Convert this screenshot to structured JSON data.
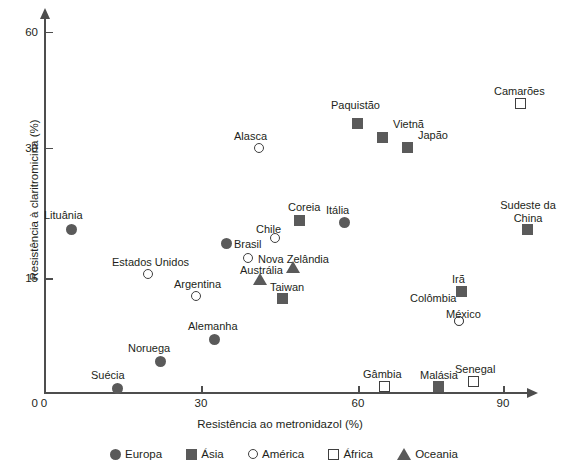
{
  "chart_data": {
    "type": "scatter",
    "title": "",
    "xlabel": "Resistência ao metronidazol (%)",
    "ylabel": "Resistência à claritromicina (%)",
    "xlim": [
      0,
      95
    ],
    "ylim": [
      0,
      63
    ],
    "xticks": [
      "0",
      "30",
      "60",
      "90"
    ],
    "yticks": [
      "0",
      "15",
      "30",
      "60"
    ],
    "grid": false,
    "legend_position": "bottom",
    "legend": [
      {
        "name": "Europa",
        "marker": "filled-circle"
      },
      {
        "name": "Ásia",
        "marker": "filled-square"
      },
      {
        "name": "América",
        "marker": "open-circle"
      },
      {
        "name": "África",
        "marker": "open-square"
      },
      {
        "name": "Oceania",
        "marker": "filled-triangle"
      }
    ],
    "points": [
      {
        "label": "Lituânia",
        "series": "Europa",
        "marker": "filled-circle",
        "x": 4,
        "y": 24,
        "px": 71,
        "py": 229,
        "lx": 44,
        "ly": 209
      },
      {
        "label": "Suécia",
        "series": "Europa",
        "marker": "filled-circle",
        "x": 14,
        "y": 3.5,
        "px": 117,
        "py": 388,
        "lx": 91,
        "ly": 369
      },
      {
        "label": "Noruega",
        "series": "Europa",
        "marker": "filled-circle",
        "x": 22,
        "y": 6,
        "px": 160,
        "py": 361,
        "lx": 128,
        "ly": 342
      },
      {
        "label": "Alemanha",
        "series": "Europa",
        "marker": "filled-circle",
        "x": 32,
        "y": 9,
        "px": 214,
        "py": 339,
        "lx": 188,
        "ly": 320
      },
      {
        "label": "Brasil",
        "series": "Europa",
        "marker": "filled-circle",
        "x": 34,
        "y": 19,
        "px": 226,
        "py": 243,
        "lx": 234,
        "ly": 238
      },
      {
        "label": "Itália",
        "series": "Europa",
        "marker": "filled-circle",
        "x": 60,
        "y": 22,
        "px": 344,
        "py": 222,
        "lx": 326,
        "ly": 204
      },
      {
        "label": "Estados Unidos",
        "series": "América",
        "marker": "open-circle",
        "x": 20,
        "y": 15.3,
        "px": 148,
        "py": 274,
        "lx": 112,
        "ly": 256
      },
      {
        "label": "Argentina",
        "series": "América",
        "marker": "open-circle",
        "x": 29,
        "y": 13.5,
        "px": 196,
        "py": 296,
        "lx": 174,
        "ly": 278
      },
      {
        "label": "Alasca",
        "series": "América",
        "marker": "open-circle",
        "x": 46,
        "y": 30.5,
        "px": 259,
        "py": 148,
        "lx": 234,
        "ly": 130
      },
      {
        "label": "Chile",
        "series": "América",
        "marker": "open-circle",
        "x": 37,
        "y": 19.5,
        "px": 275,
        "py": 238,
        "lx": 256,
        "ly": 223
      },
      {
        "label": "Nova Zelândia",
        "series": "América",
        "marker": "open-circle",
        "x": 38,
        "y": 17,
        "px": 248,
        "py": 258,
        "lx": 258,
        "ly": 253
      },
      {
        "label": "Colômbia",
        "series": "América",
        "marker": "open-circle",
        "x": 76,
        "y": 13,
        "px": 459,
        "py": 321,
        "lx": 410,
        "ly": 292
      },
      {
        "label": "México",
        "series": "América",
        "marker": "open-circle",
        "x": 76,
        "y": 11,
        "px": 459,
        "py": 321,
        "lx": 446,
        "ly": 308
      },
      {
        "label": "Paquistão",
        "series": "Ásia",
        "marker": "filled-square",
        "x": 61,
        "y": 38,
        "px": 357,
        "py": 123,
        "lx": 331,
        "ly": 99
      },
      {
        "label": "Vietnã",
        "series": "Ásia",
        "marker": "filled-square",
        "x": 65,
        "y": 34,
        "px": 382,
        "py": 137,
        "lx": 393,
        "ly": 118
      },
      {
        "label": "Japão",
        "series": "Ásia",
        "marker": "filled-square",
        "x": 70,
        "y": 32,
        "px": 407,
        "py": 147,
        "lx": 418,
        "ly": 129
      },
      {
        "label": "Coreia",
        "series": "Ásia",
        "marker": "filled-square",
        "x": 57,
        "y": 22,
        "px": 299,
        "py": 220,
        "lx": 288,
        "ly": 201
      },
      {
        "label": "Taiwan",
        "series": "Ásia",
        "marker": "filled-square",
        "x": 42,
        "y": 13.5,
        "px": 282,
        "py": 298,
        "lx": 270,
        "ly": 281
      },
      {
        "label": "Irã",
        "series": "Ásia",
        "marker": "filled-square",
        "x": 80,
        "y": 14,
        "px": 461,
        "py": 291,
        "lx": 452,
        "ly": 273
      },
      {
        "label": "Malásia",
        "series": "Ásia",
        "marker": "filled-square",
        "x": 77,
        "y": 2,
        "px": 438,
        "py": 386,
        "lx": 420,
        "ly": 369
      },
      {
        "label": "Sudeste da China",
        "series": "Ásia",
        "marker": "filled-square",
        "x": 92,
        "y": 21,
        "px": 527,
        "py": 229,
        "lx": 496,
        "ly": 199
      },
      {
        "label": "Camarões",
        "series": "África",
        "marker": "open-square",
        "x": 92,
        "y": 41,
        "px": 520,
        "py": 103,
        "lx": 494,
        "ly": 85
      },
      {
        "label": "Gâmbia",
        "series": "África",
        "marker": "open-square",
        "x": 65,
        "y": 2,
        "px": 384,
        "py": 386,
        "lx": 363,
        "ly": 368
      },
      {
        "label": "Senegal",
        "series": "África",
        "marker": "open-square",
        "x": 82,
        "y": 2.5,
        "px": 473,
        "py": 381,
        "lx": 455,
        "ly": 363
      },
      {
        "label": "Austrália",
        "series": "Oceania",
        "marker": "filled-triangle",
        "x": 38,
        "y": 15,
        "px": 258,
        "py": 278,
        "lx": 240,
        "ly": 264
      },
      {
        "label": "Nova Zelândia2",
        "series": "Oceania",
        "marker": "filled-triangle",
        "x": 45,
        "y": 16.5,
        "px": 291,
        "py": 266,
        "lx": 0,
        "ly": 0
      }
    ]
  },
  "axis": {
    "y_ticks": [
      {
        "value": "60",
        "py": 31.5
      },
      {
        "value": "30",
        "py": 147.5
      },
      {
        "value": "15",
        "py": 278
      },
      {
        "value": "0",
        "py": 393
      }
    ],
    "x_ticks": [
      {
        "value": "0",
        "px": 44
      },
      {
        "value": "30",
        "px": 201
      },
      {
        "value": "60",
        "px": 358
      },
      {
        "value": "90",
        "px": 503
      }
    ]
  }
}
